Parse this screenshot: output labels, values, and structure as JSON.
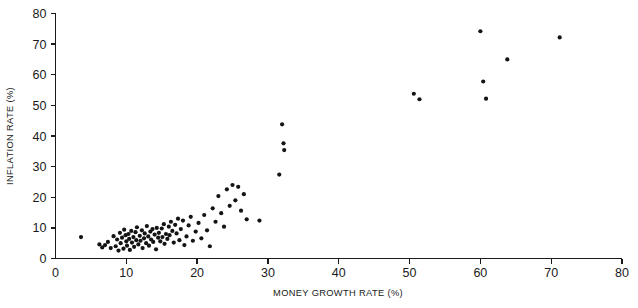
{
  "chart_data": {
    "type": "scatter",
    "title": "",
    "xlabel": "MONEY GROWTH RATE (%)",
    "ylabel": "INFLATION RATE (%)",
    "xlim": [
      0,
      80
    ],
    "ylim": [
      0,
      80
    ],
    "xticks": [
      0,
      10,
      20,
      30,
      40,
      50,
      60,
      70,
      80
    ],
    "yticks": [
      0,
      10,
      20,
      30,
      40,
      50,
      60,
      70,
      80
    ],
    "grid": false,
    "legend": null,
    "marker": "filled-circle",
    "marker_color": "#141414",
    "marker_size": 4.2,
    "points": [
      [
        3.6,
        7.0
      ],
      [
        6.2,
        4.6
      ],
      [
        6.6,
        3.6
      ],
      [
        7.0,
        4.4
      ],
      [
        7.4,
        5.4
      ],
      [
        7.8,
        3.4
      ],
      [
        8.2,
        7.3
      ],
      [
        8.5,
        4.0
      ],
      [
        8.7,
        6.2
      ],
      [
        8.9,
        2.6
      ],
      [
        9.1,
        8.4
      ],
      [
        9.2,
        5.0
      ],
      [
        9.4,
        6.8
      ],
      [
        9.6,
        3.2
      ],
      [
        9.7,
        9.4
      ],
      [
        9.9,
        7.6
      ],
      [
        10.0,
        5.6
      ],
      [
        10.1,
        4.2
      ],
      [
        10.3,
        8.0
      ],
      [
        10.4,
        6.4
      ],
      [
        10.5,
        2.8
      ],
      [
        10.7,
        9.0
      ],
      [
        10.8,
        5.2
      ],
      [
        11.0,
        7.0
      ],
      [
        11.1,
        3.8
      ],
      [
        11.3,
        8.6
      ],
      [
        11.4,
        6.0
      ],
      [
        11.5,
        10.2
      ],
      [
        11.7,
        4.6
      ],
      [
        11.9,
        7.4
      ],
      [
        12.0,
        5.8
      ],
      [
        12.2,
        9.2
      ],
      [
        12.3,
        3.4
      ],
      [
        12.5,
        6.6
      ],
      [
        12.6,
        8.2
      ],
      [
        12.8,
        5.0
      ],
      [
        12.9,
        10.6
      ],
      [
        13.1,
        7.2
      ],
      [
        13.2,
        4.2
      ],
      [
        13.4,
        8.8
      ],
      [
        13.5,
        6.2
      ],
      [
        13.7,
        9.6
      ],
      [
        13.8,
        5.4
      ],
      [
        14.0,
        7.8
      ],
      [
        14.2,
        3.0
      ],
      [
        14.3,
        10.0
      ],
      [
        14.5,
        6.8
      ],
      [
        14.6,
        8.4
      ],
      [
        14.8,
        5.6
      ],
      [
        15.0,
        9.8
      ],
      [
        15.1,
        7.0
      ],
      [
        15.3,
        11.2
      ],
      [
        15.4,
        4.8
      ],
      [
        15.6,
        8.0
      ],
      [
        15.8,
        6.4
      ],
      [
        16.0,
        10.4
      ],
      [
        16.1,
        7.6
      ],
      [
        16.3,
        12.0
      ],
      [
        16.5,
        9.0
      ],
      [
        16.7,
        5.2
      ],
      [
        16.9,
        11.0
      ],
      [
        17.1,
        8.2
      ],
      [
        17.3,
        13.0
      ],
      [
        17.5,
        6.0
      ],
      [
        17.7,
        9.6
      ],
      [
        18.0,
        12.4
      ],
      [
        18.2,
        4.4
      ],
      [
        18.5,
        7.2
      ],
      [
        18.8,
        10.8
      ],
      [
        19.1,
        13.6
      ],
      [
        19.4,
        5.8
      ],
      [
        19.8,
        8.8
      ],
      [
        20.2,
        11.6
      ],
      [
        20.6,
        6.6
      ],
      [
        21.0,
        14.2
      ],
      [
        21.4,
        9.2
      ],
      [
        21.8,
        4.0
      ],
      [
        22.2,
        16.4
      ],
      [
        22.6,
        12.0
      ],
      [
        23.0,
        20.4
      ],
      [
        23.4,
        14.8
      ],
      [
        23.8,
        10.4
      ],
      [
        24.2,
        22.6
      ],
      [
        24.6,
        17.2
      ],
      [
        25.0,
        24.0
      ],
      [
        25.4,
        19.0
      ],
      [
        25.8,
        23.4
      ],
      [
        26.2,
        15.6
      ],
      [
        26.6,
        21.0
      ],
      [
        27.0,
        12.8
      ],
      [
        28.8,
        12.4
      ],
      [
        31.6,
        27.4
      ],
      [
        32.0,
        43.8
      ],
      [
        32.2,
        37.6
      ],
      [
        32.3,
        35.4
      ],
      [
        50.6,
        53.8
      ],
      [
        51.4,
        52.0
      ],
      [
        60.0,
        74.2
      ],
      [
        60.4,
        57.8
      ],
      [
        60.8,
        52.2
      ],
      [
        63.8,
        65.0
      ],
      [
        71.2,
        72.2
      ]
    ]
  },
  "axes": {
    "x_tick_labels": [
      "0",
      "10",
      "20",
      "30",
      "40",
      "50",
      "60",
      "70",
      "80"
    ],
    "y_tick_labels": [
      "0",
      "10",
      "20",
      "30",
      "40",
      "50",
      "60",
      "70",
      "80"
    ]
  }
}
